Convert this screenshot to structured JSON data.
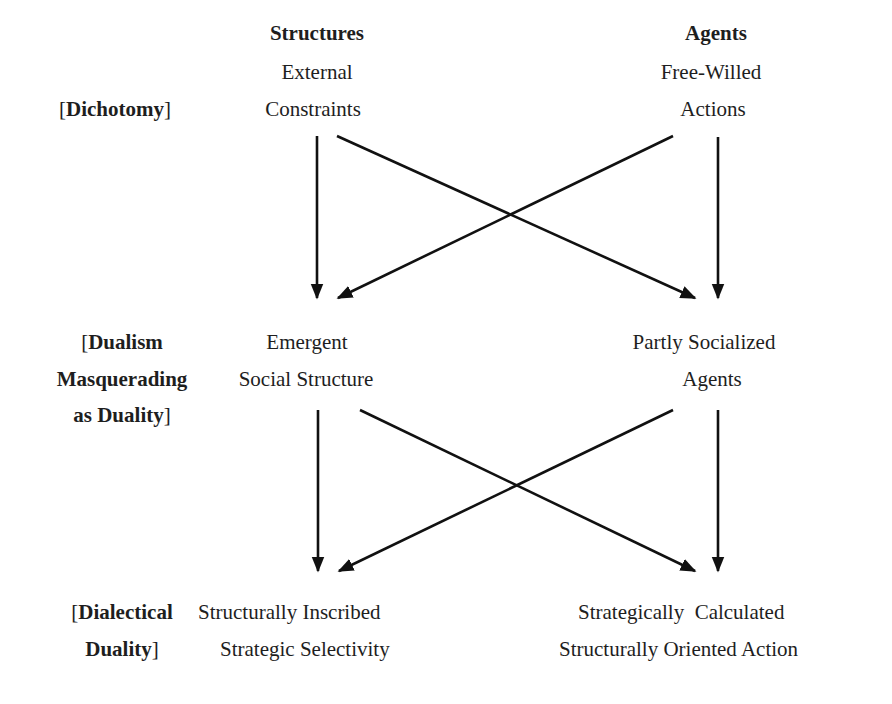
{
  "columns": {
    "structures_header": "Structures",
    "agents_header": "Agents"
  },
  "rows": [
    {
      "label_parts": [
        [
          "[",
          "Dichotomy",
          "]"
        ]
      ],
      "structure_lines": [
        "External",
        "Constraints"
      ],
      "agent_lines": [
        "Free-Willed",
        "Actions"
      ]
    },
    {
      "label_parts": [
        [
          "[",
          "Dualism",
          ""
        ],
        [
          "",
          "Masquerading",
          ""
        ],
        [
          "",
          "as Duality",
          "]"
        ]
      ],
      "structure_lines": [
        "Emergent",
        "Social Structure"
      ],
      "agent_lines": [
        "Partly Socialized",
        "Agents"
      ]
    },
    {
      "label_parts": [
        [
          "[",
          "Dialectical",
          ""
        ],
        [
          "",
          "Duality",
          "]"
        ]
      ],
      "structure_lines": [
        "Structurally Inscribed",
        "Strategic Selectivity"
      ],
      "agent_lines": [
        "Strategically  Calculated",
        "Structurally Oriented Action"
      ]
    }
  ],
  "arrows": [
    {
      "from": "External Constraints",
      "to": "Emergent Social Structure"
    },
    {
      "from": "External Constraints",
      "to": "Partly Socialized Agents"
    },
    {
      "from": "Free-Willed Actions",
      "to": "Emergent Social Structure"
    },
    {
      "from": "Free-Willed Actions",
      "to": "Partly Socialized Agents"
    },
    {
      "from": "Emergent Social Structure",
      "to": "Structurally Inscribed Strategic Selectivity"
    },
    {
      "from": "Emergent Social Structure",
      "to": "Strategically Calculated Structurally Oriented Action"
    },
    {
      "from": "Partly Socialized Agents",
      "to": "Structurally Inscribed Strategic Selectivity"
    },
    {
      "from": "Partly Socialized Agents",
      "to": "Strategically Calculated Structurally Oriented Action"
    }
  ],
  "colors": {
    "text": "#1e1e1e",
    "arrow": "#111111",
    "background": "#ffffff"
  }
}
